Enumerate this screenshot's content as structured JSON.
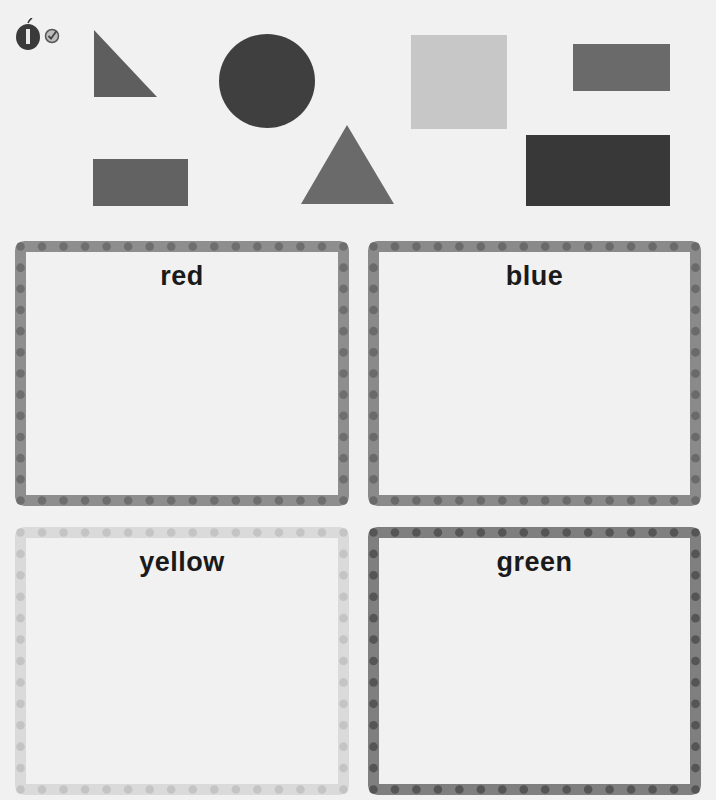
{
  "header": {
    "logo_icon": "apple-icon",
    "badge_icon": "checkmark-icon"
  },
  "shapes": [
    {
      "type": "right-triangle",
      "shade": "#5e5e5e"
    },
    {
      "type": "circle",
      "shade": "#3f3f3f"
    },
    {
      "type": "square",
      "shade": "#c7c7c7"
    },
    {
      "type": "rectangle",
      "shade": "#6a6a6a"
    },
    {
      "type": "rectangle",
      "shade": "#626262"
    },
    {
      "type": "triangle",
      "shade": "#6a6a6a"
    },
    {
      "type": "rectangle",
      "shade": "#383838"
    }
  ],
  "boxes": [
    {
      "label": "red",
      "border_color": "#8e8e8e",
      "dot_color": "#6e6e6e"
    },
    {
      "label": "blue",
      "border_color": "#8a8a8a",
      "dot_color": "#6a6a6a"
    },
    {
      "label": "yellow",
      "border_color": "#dadada",
      "dot_color": "#c4c4c4"
    },
    {
      "label": "green",
      "border_color": "#7f7f7f",
      "dot_color": "#555555"
    }
  ]
}
